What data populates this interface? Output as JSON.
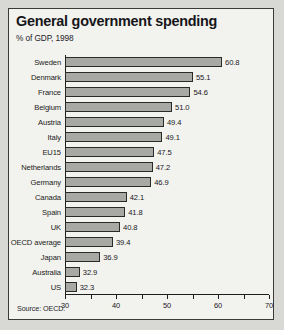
{
  "chart_data": {
    "type": "bar",
    "orientation": "horizontal",
    "title": "General government spending",
    "subtitle": "% of GDP, 1998",
    "source": "Source: OECD.",
    "xlabel": "",
    "ylabel": "",
    "xlim": [
      30,
      70
    ],
    "xticks": [
      30,
      35,
      40,
      45,
      50,
      55,
      60,
      65,
      70
    ],
    "xtick_labels": [
      "30",
      "",
      "40",
      "",
      "50",
      "",
      "60",
      "",
      "70"
    ],
    "grid": false,
    "legend": false,
    "bar_color": "#a8a8a4",
    "bar_edge_color": "#2a2a28",
    "categories": [
      "Sweden",
      "Denmark",
      "France",
      "Belgium",
      "Austria",
      "Italy",
      "EU15",
      "Netherlands",
      "Germany",
      "Canada",
      "Spain",
      "UK",
      "OECD average",
      "Japan",
      "Australia",
      "US"
    ],
    "values": [
      60.8,
      55.1,
      54.6,
      51.0,
      49.4,
      49.1,
      47.5,
      47.2,
      46.9,
      42.1,
      41.8,
      40.8,
      39.4,
      36.9,
      32.9,
      32.3
    ],
    "value_labels": [
      "60.8",
      "55.1",
      "54.6",
      "51.0",
      "49.4",
      "49.1",
      "47.5",
      "47.2",
      "46.9",
      "42.1",
      "41.8",
      "40.8",
      "39.4",
      "36.9",
      "32.9",
      "32.3"
    ]
  }
}
